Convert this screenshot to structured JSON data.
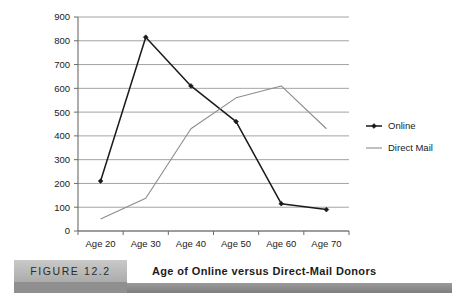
{
  "figure": {
    "badge_label": "FIGURE 12.2",
    "caption": "Age of Online versus Direct-Mail Donors"
  },
  "chart_data": {
    "type": "line",
    "title": "Age of Online versus Direct-Mail Donors",
    "xlabel": "",
    "ylabel": "",
    "categories": [
      "Age 20",
      "Age 30",
      "Age 40",
      "Age 50",
      "Age 60",
      "Age 70"
    ],
    "series": [
      {
        "name": "Online",
        "color": "#1a1a1a",
        "marker": "diamond",
        "values": [
          210,
          815,
          610,
          460,
          115,
          90
        ]
      },
      {
        "name": "Direct Mail",
        "color": "#8c8c8c",
        "marker": "none",
        "values": [
          50,
          138,
          430,
          560,
          610,
          430
        ]
      }
    ],
    "ylim": [
      0,
      900
    ],
    "ytick_values": [
      0,
      100,
      200,
      300,
      400,
      500,
      600,
      700,
      800,
      900
    ],
    "ytick_labels": [
      "0",
      "100",
      "200",
      "300",
      "400",
      "500",
      "600",
      "700",
      "800",
      "900"
    ],
    "grid": true,
    "legend_position": "right"
  },
  "legend": {
    "entries": [
      {
        "label": "Online",
        "color": "#1a1a1a",
        "marker": "diamond"
      },
      {
        "label": "Direct Mail",
        "color": "#8c8c8c",
        "marker": "none"
      }
    ]
  }
}
